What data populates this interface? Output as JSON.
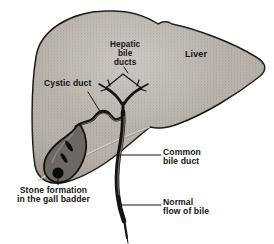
{
  "diagram": {
    "type": "anatomical-illustration",
    "background_color": "#ffffff",
    "ink_color": "#15120f",
    "liver_fill_color": "#b3aca4",
    "duct_color": "#1a1714",
    "gallbladder_fill_color": "#6d6761",
    "stone_color": "#0d0b09"
  },
  "labels": {
    "hepatic_bile_ducts": "Hepatic\nbile\nducts",
    "liver": "Liver",
    "cystic_duct": "Cystic duct",
    "common_bile_duct": "Common\nbile duct",
    "normal_flow_of_bile": "Normal\nflow of bile",
    "stone_formation": "Stone formation\nin the gall badder"
  },
  "structures": [
    {
      "name": "liver",
      "label": "Liver"
    },
    {
      "name": "hepatic-bile-ducts",
      "label": "Hepatic bile ducts"
    },
    {
      "name": "cystic-duct",
      "label": "Cystic duct"
    },
    {
      "name": "gallbladder",
      "label": "Gall badder"
    },
    {
      "name": "gallstones",
      "label": "Stone formation",
      "count": 3
    },
    {
      "name": "common-bile-duct",
      "label": "Common bile duct"
    },
    {
      "name": "bile-flow",
      "label": "Normal flow of bile"
    }
  ]
}
